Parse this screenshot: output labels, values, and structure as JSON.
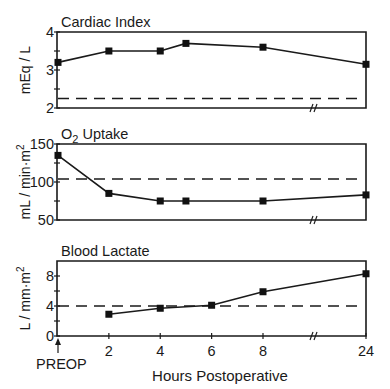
{
  "chart_data": {
    "type": "line",
    "layout": "three vertically stacked panels sharing x-axis",
    "x_axis": {
      "label": "Hours Postoperative",
      "tick_labels": [
        "2",
        "4",
        "6",
        "8",
        "24"
      ],
      "tick_hours": [
        2,
        4,
        6,
        8,
        24
      ],
      "origin_label": "PREOP",
      "origin_marker": "up-arrow",
      "axis_break_between": [
        8,
        24
      ]
    },
    "panels": [
      {
        "title": "Cardiac Index",
        "ylabel": "mEq / L",
        "ylim": [
          2,
          4
        ],
        "yticks": [
          2,
          3,
          4
        ],
        "minor_yticks": [
          2.5,
          3.5
        ],
        "reference_line": 2.25,
        "series": [
          {
            "name": "Cardiac Index",
            "x": [
              "PREOP",
              2,
              4,
              5,
              8,
              24
            ],
            "values": [
              3.2,
              3.5,
              3.5,
              3.7,
              3.6,
              3.15
            ]
          }
        ]
      },
      {
        "title": "O2 Uptake",
        "title_main": "O",
        "title_sub": "2",
        "title_rest": " Uptake",
        "ylabel": "mL / min·m²",
        "ylabel_main": "mL / min·m",
        "ylabel_sup": "2",
        "ylim": [
          50,
          150
        ],
        "yticks": [
          50,
          100,
          150
        ],
        "minor_yticks": [
          75,
          125
        ],
        "reference_line": 104,
        "series": [
          {
            "name": "O2 Uptake",
            "x": [
              "PREOP",
              2,
              4,
              5,
              8,
              24
            ],
            "values": [
              135,
              85,
              75,
              75,
              75,
              83
            ]
          }
        ]
      },
      {
        "title": "Blood Lactate",
        "ylabel": "L / mm·m²",
        "ylabel_main": "L / mm·m",
        "ylabel_sup": "2",
        "ylim": [
          0,
          10
        ],
        "yticks": [
          0,
          4,
          8
        ],
        "minor_yticks": [
          2,
          6
        ],
        "reference_line": 4,
        "series": [
          {
            "name": "Blood Lactate",
            "x": [
              2,
              4,
              6,
              8,
              24
            ],
            "values": [
              2.9,
              3.7,
              4.1,
              5.9,
              8.3
            ]
          }
        ]
      }
    ],
    "grid": false,
    "legend": "none"
  }
}
